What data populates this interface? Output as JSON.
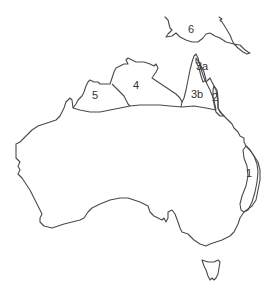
{
  "map": {
    "title": "",
    "stroke_color": "#4a4a4a",
    "background": "#ffffff",
    "regions": [
      {
        "id": "1",
        "label": "1",
        "x": 246,
        "y": 177
      },
      {
        "id": "2",
        "label": "2",
        "x": 214,
        "y": 100
      },
      {
        "id": "3a",
        "label": "3a",
        "x": 198,
        "y": 70
      },
      {
        "id": "3b",
        "label": "3b",
        "x": 193,
        "y": 98
      },
      {
        "id": "4",
        "label": "4",
        "x": 133,
        "y": 89
      },
      {
        "id": "5",
        "label": "5",
        "x": 93,
        "y": 98
      },
      {
        "id": "6",
        "label": "6",
        "x": 188,
        "y": 33
      }
    ]
  }
}
